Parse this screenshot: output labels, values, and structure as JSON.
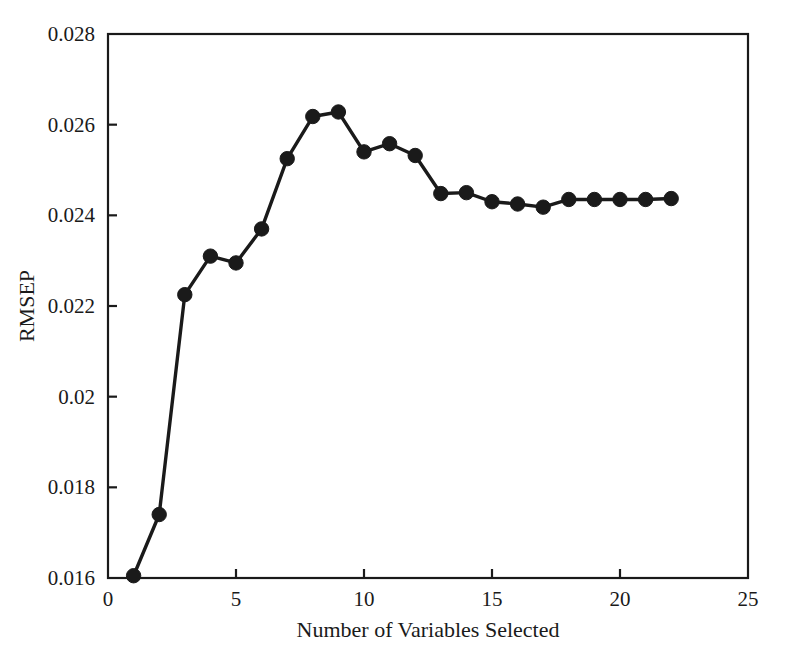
{
  "figure": {
    "background_color": "#ffffff",
    "line_color": "#1a1a1a",
    "marker_color": "#1a1a1a",
    "axis_color": "#1a1a1a"
  },
  "chart_data": {
    "type": "line",
    "title": "",
    "xlabel": "Number of Variables Selected",
    "ylabel": "RMSEP",
    "xlim": [
      0,
      25
    ],
    "ylim": [
      0.016,
      0.028
    ],
    "xticks": [
      0,
      5,
      10,
      15,
      20,
      25
    ],
    "xtick_labels": [
      "0",
      "5",
      "10",
      "15",
      "20",
      "25"
    ],
    "yticks": [
      0.016,
      0.018,
      0.02,
      0.022,
      0.024,
      0.026,
      0.028
    ],
    "ytick_labels": [
      "0.016",
      "0.018",
      "0.02",
      "0.022",
      "0.024",
      "0.026",
      "0.028"
    ],
    "grid": false,
    "legend": null,
    "marker": "filled-circle",
    "x": [
      1,
      2,
      3,
      4,
      5,
      6,
      7,
      8,
      9,
      10,
      11,
      12,
      13,
      14,
      15,
      16,
      17,
      18,
      19,
      20,
      21,
      22
    ],
    "values": [
      0.01605,
      0.0174,
      0.02225,
      0.0231,
      0.02295,
      0.0237,
      0.02525,
      0.02618,
      0.02628,
      0.0254,
      0.02558,
      0.02532,
      0.02448,
      0.0245,
      0.0243,
      0.02425,
      0.02418,
      0.02435,
      0.02435,
      0.02435,
      0.02435,
      0.02437
    ],
    "series": [
      {
        "name": "RMSEP",
        "values": [
          0.01605,
          0.0174,
          0.02225,
          0.0231,
          0.02295,
          0.0237,
          0.02525,
          0.02618,
          0.02628,
          0.0254,
          0.02558,
          0.02532,
          0.02448,
          0.0245,
          0.0243,
          0.02425,
          0.02418,
          0.02435,
          0.02435,
          0.02435,
          0.02435,
          0.02437
        ]
      }
    ]
  },
  "caption": {
    "ghost_text": ""
  }
}
